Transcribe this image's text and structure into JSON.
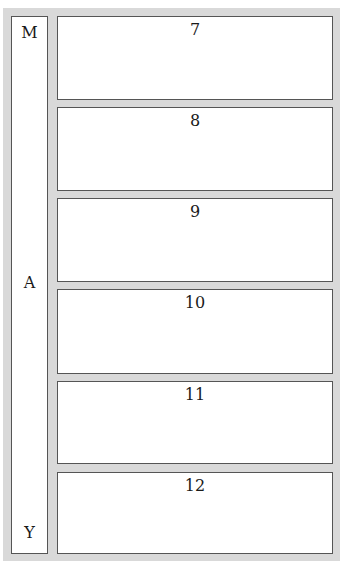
{
  "month": {
    "letters": [
      "M",
      "A",
      "Y"
    ]
  },
  "days": [
    {
      "number": "7"
    },
    {
      "number": "8"
    },
    {
      "number": "9"
    },
    {
      "number": "10"
    },
    {
      "number": "11"
    },
    {
      "number": "12"
    }
  ]
}
